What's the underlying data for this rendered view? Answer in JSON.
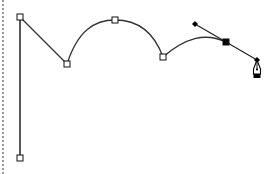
{
  "canvas": {
    "width": 275,
    "height": 174,
    "background": "#ffffff",
    "stroke_color": "#333333",
    "anchor_fill_open": "#ffffff",
    "anchor_fill_selected": "#000000",
    "edge_color": "#9a9a9a"
  },
  "path": {
    "description": "Bezier path being drawn with pen tool",
    "segments": [
      {
        "type": "line",
        "from": [
          20,
          158
        ],
        "to": [
          20,
          17
        ]
      },
      {
        "type": "line",
        "from": [
          20,
          17
        ],
        "to": [
          67,
          64
        ]
      },
      {
        "type": "curve",
        "from": [
          67,
          64
        ],
        "c1": [
          78,
          30
        ],
        "c2": [
          95,
          20
        ],
        "to": [
          115,
          20
        ]
      },
      {
        "type": "curve",
        "from": [
          115,
          20
        ],
        "c1": [
          140,
          20
        ],
        "c2": [
          155,
          35
        ],
        "to": [
          163,
          57
        ]
      },
      {
        "type": "curve",
        "from": [
          163,
          57
        ],
        "c1": [
          185,
          38
        ],
        "c2": [
          205,
          32
        ],
        "to": [
          226,
          42
        ]
      }
    ]
  },
  "anchors": [
    {
      "id": "anchor-bottom",
      "x": 20,
      "y": 158,
      "selected": false
    },
    {
      "id": "anchor-top-left",
      "x": 20,
      "y": 17,
      "selected": false
    },
    {
      "id": "anchor-dip-1",
      "x": 67,
      "y": 64,
      "selected": false
    },
    {
      "id": "anchor-arc-top",
      "x": 115,
      "y": 20,
      "selected": false
    },
    {
      "id": "anchor-dip-2",
      "x": 163,
      "y": 57,
      "selected": false
    },
    {
      "id": "anchor-active",
      "x": 226,
      "y": 42,
      "selected": true
    }
  ],
  "handles": {
    "line_from": [
      195,
      24
    ],
    "line_to": [
      257,
      60
    ],
    "points": [
      {
        "id": "handle-in",
        "x": 195,
        "y": 24
      },
      {
        "id": "handle-out",
        "x": 257,
        "y": 60
      }
    ]
  },
  "cursor": {
    "tool": "pen-tool",
    "x": 257,
    "y": 60
  }
}
